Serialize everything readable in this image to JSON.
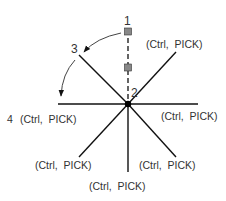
{
  "diagram": {
    "colors": {
      "line": "#111111",
      "text": "#333333",
      "grip": "#888888",
      "background": "#ffffff"
    },
    "point_labels": {
      "p1": "1",
      "p2": "2",
      "p3": "3",
      "p4": "4"
    },
    "pick_labels": {
      "upper_right": "(Ctrl,  PICK)",
      "left": "(Ctrl,  PICK)",
      "right": "(Ctrl,  PICK)",
      "lower_left": "(Ctrl,  PICK)",
      "lower_right": "(Ctrl,  PICK)",
      "bottom": "(Ctrl,  PICK)"
    },
    "icons": {
      "grip": "square-grip-icon",
      "center": "pivot-dot-icon",
      "arrow": "arrowhead-icon"
    }
  }
}
